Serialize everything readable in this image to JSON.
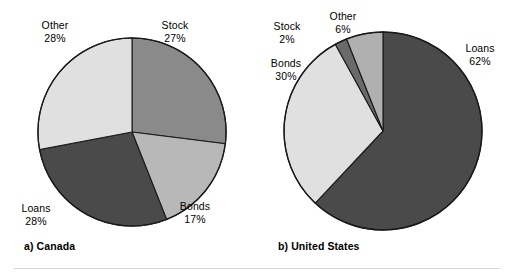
{
  "figure": {
    "background": "#ffffff",
    "outline_color": "#1a1a1a"
  },
  "palette": {
    "dark": "#4a4a4a",
    "medium_dark": "#6a6a6a",
    "medium": "#8a8a8a",
    "medium_light": "#b0b0b0",
    "light": "#b8b8b8",
    "very_light": "#e0e0e0"
  },
  "panels": {
    "canada": {
      "caption": "a) Canada",
      "labels": {
        "other": {
          "name": "Other",
          "pct": "28%"
        },
        "stock": {
          "name": "Stock",
          "pct": "27%"
        },
        "bonds": {
          "name": "Bonds",
          "pct": "17%"
        },
        "loans": {
          "name": "Loans",
          "pct": "28%"
        }
      }
    },
    "united_states": {
      "caption": "b) United States",
      "labels": {
        "other": {
          "name": "Other",
          "pct": "6%"
        },
        "stock": {
          "name": "Stock",
          "pct": "2%"
        },
        "bonds": {
          "name": "Bonds",
          "pct": "30%"
        },
        "loans": {
          "name": "Loans",
          "pct": "62%"
        }
      }
    }
  },
  "chart_data": [
    {
      "type": "pie",
      "title": "a) Canada",
      "labels": [
        "Stock",
        "Bonds",
        "Loans",
        "Other"
      ],
      "values": [
        27,
        17,
        28,
        28
      ],
      "unit": "percent",
      "start_angle_deg": 0,
      "direction": "clockwise",
      "colors": [
        "#8a8a8a",
        "#b8b8b8",
        "#4a4a4a",
        "#e0e0e0"
      ],
      "data_labels": [
        "27%",
        "17%",
        "28%",
        "28%"
      ],
      "legend": "none (labels placed outside slices)"
    },
    {
      "type": "pie",
      "title": "b) United States",
      "labels": [
        "Loans",
        "Bonds",
        "Stock",
        "Other"
      ],
      "values": [
        62,
        30,
        2,
        6
      ],
      "unit": "percent",
      "start_angle_deg": 0,
      "direction": "clockwise",
      "colors": [
        "#4a4a4a",
        "#e0e0e0",
        "#6a6a6a",
        "#b0b0b0"
      ],
      "data_labels": [
        "62%",
        "30%",
        "2%",
        "6%"
      ],
      "legend": "none (labels placed outside slices)"
    }
  ]
}
